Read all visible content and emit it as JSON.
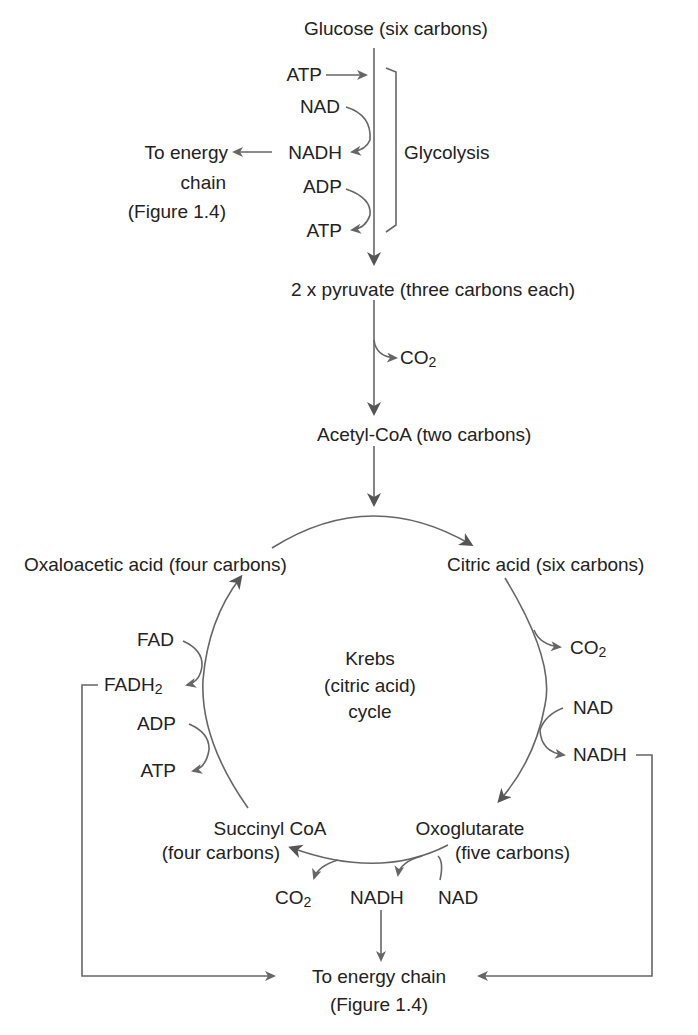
{
  "glycolysis": {
    "glucose": "Glucose (six carbons)",
    "atp_in": "ATP",
    "nad": "NAD",
    "nadh": "NADH",
    "adp": "ADP",
    "atp_out": "ATP",
    "bracket_label": "Glycolysis",
    "to_energy_line1": "To energy",
    "to_energy_line2": "chain",
    "to_energy_line3": "(Figure 1.4)"
  },
  "link_reaction": {
    "pyruvate": "2 x pyruvate (three carbons each)",
    "co2_base": "CO",
    "co2_sub": "2",
    "acetyl_coa": "Acetyl-CoA (two carbons)"
  },
  "krebs": {
    "center_line1": "Krebs",
    "center_line2": "(citric acid)",
    "center_line3": "cycle",
    "oxaloacetic": "Oxaloacetic acid (four carbons)",
    "citric": "Citric acid (six carbons)",
    "co2_right_base": "CO",
    "co2_right_sub": "2",
    "nad_right": "NAD",
    "nadh_right": "NADH",
    "oxoglutarate_line1": "Oxoglutarate",
    "oxoglutarate_line2": "(five carbons)",
    "succinyl_line1": "Succinyl CoA",
    "succinyl_line2": "(four carbons)",
    "co2_bottom_base": "CO",
    "co2_bottom_sub": "2",
    "nadh_bottom": "NADH",
    "nad_bottom": "NAD",
    "fad": "FAD",
    "fadh2_base": "FADH",
    "fadh2_sub": "2",
    "adp_left": "ADP",
    "atp_left": "ATP"
  },
  "output": {
    "line1": "To energy chain",
    "line2": "(Figure 1.4)"
  },
  "colors": {
    "line": "#666666",
    "text": "#222222"
  }
}
